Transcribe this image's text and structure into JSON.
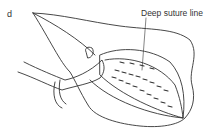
{
  "figure": {
    "panel_label": "d",
    "annotations": [
      {
        "text": "Deep suture line",
        "points_to": "dashed suture rows on the opened tissue"
      }
    ],
    "colors": {
      "line": "#333333",
      "background": "#ffffff"
    }
  }
}
